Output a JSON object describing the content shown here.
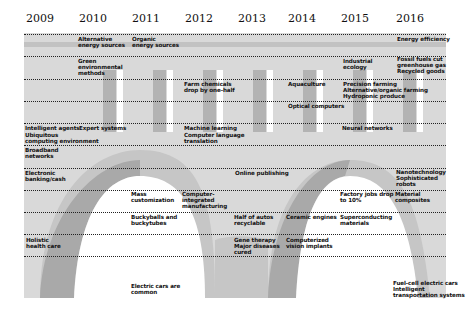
{
  "years": [
    "2009",
    "2010",
    "2011",
    "2012",
    "2013",
    "2014",
    "2015",
    "2016"
  ],
  "colors": {
    "panel": "#d9d9d9",
    "band_dark": "#bdbdbd",
    "bar_dark": "#b0b0b0",
    "bar_light": "#ffffff",
    "arch_dark": "#a9a9a9",
    "arch_mid": "#c4c4c4",
    "arch_inner": "#ffffff"
  },
  "labels": {
    "alternative_energy": "Alternative\nenergy sources",
    "organic_energy": "Organic\nenergy sources",
    "energy_efficiency": "Energy efficiency",
    "green_methods": "Green\nenvironmental\nmethods",
    "industrial_ecology": "Industrial\necology",
    "fossil_fuels": "Fossil fuels cut\ngreenhouse gas\nRecycled goods",
    "farm_chemicals": "Farm chemicals\ndrop by one-half",
    "aquaculture": "Aquaculture",
    "precision_farming": "Precision farming\nAlternative/organic farming\nHydroponic produce",
    "optical_computers": "Optical computers",
    "intelligent_agents": "Intelligent agents",
    "expert_systems": "Expert systems",
    "machine_learning": "Machine learning",
    "computer_translation": "Computer language\ntranslation",
    "neural_networks": "Neural networks",
    "ubiquitous_computing": "Ubiquitous\ncomputing environment",
    "broadband": "Broadband\nnetworks",
    "electronic_banking": "Electronic\nbanking/cash",
    "online_publishing": "Online publishing",
    "nanotechnology": "Nanotechnology\nSophisticated\nrobots",
    "mass_customization": "Mass\ncustomization",
    "computer_integrated": "Computer-\nintegrated\nmanufacturing",
    "factory_jobs": "Factory jobs drop\nto 10%",
    "material_composites": "Material\ncomposites",
    "buckyballs": "Buckyballs and\nbuckytubes",
    "half_autos": "Half of autos\nrecyclable",
    "ceramic_engines": "Ceramic engines",
    "superconducting": "Superconducting\nmaterials",
    "holistic_health": "Holistic\nhealth care",
    "gene_therapy": "Gene therapy\nMajor diseases\ncured",
    "computerized_vision": "Computerized\nvision implants",
    "electric_cars": "Electric cars are\ncommon",
    "fuel_cell": "Fuel-cell electric cars\nIntelligent\ntransportation systems"
  }
}
